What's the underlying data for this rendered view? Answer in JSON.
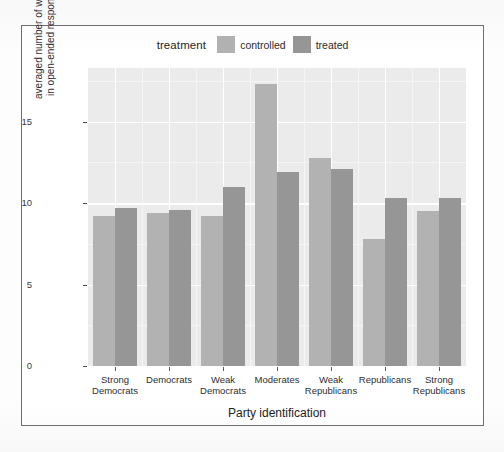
{
  "legend": {
    "title": "treatment",
    "items": [
      {
        "label": "controlled",
        "color": "#b2b2b2"
      },
      {
        "label": "treated",
        "color": "#969696"
      }
    ]
  },
  "axes": {
    "x_title": "Party identification",
    "y_title": "averaged number of words\nin open-ended responses",
    "y_ticks": [
      "0",
      "5",
      "10",
      "15"
    ]
  },
  "chart_data": {
    "type": "bar",
    "title": "",
    "xlabel": "Party identification",
    "ylabel": "averaged number of words in open-ended responses",
    "ylim": [
      0,
      18.3
    ],
    "y_ticks": [
      0,
      5,
      10,
      15
    ],
    "y_minor_ticks": [
      2.5,
      7.5,
      12.5,
      17.5
    ],
    "grid": true,
    "legend_position": "top",
    "legend_title": "treatment",
    "categories": [
      "Strong\nDemocrats",
      "Democrats",
      "Weak\nDemocrats",
      "Moderates",
      "Weak\nRepublicans",
      "Republicans",
      "Strong\nRepublicans"
    ],
    "categories_flat": [
      "Strong Democrats",
      "Democrats",
      "Weak Democrats",
      "Moderates",
      "Weak Republicans",
      "Republicans",
      "Strong Republicans"
    ],
    "series": [
      {
        "name": "controlled",
        "color": "#b2b2b2",
        "values": [
          9.2,
          9.4,
          9.2,
          17.3,
          12.8,
          7.8,
          9.5
        ]
      },
      {
        "name": "treated",
        "color": "#969696",
        "values": [
          9.7,
          9.6,
          11.0,
          11.9,
          12.1,
          10.3,
          10.3
        ]
      }
    ]
  },
  "style": {
    "panel_bg": "#ebebeb",
    "gridline": "#ffffff",
    "page_bg": "#ffffff",
    "frame": "#6f6f6f"
  }
}
